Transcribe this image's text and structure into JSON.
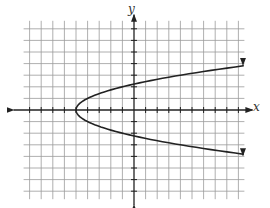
{
  "chart_data": {
    "type": "line",
    "title": "",
    "xlabel": "x",
    "ylabel": "y",
    "xlim": [
      -9,
      9
    ],
    "ylim": [
      -7,
      7
    ],
    "grid": true,
    "grid_step": 1,
    "axis_ticks": true,
    "series": [
      {
        "name": "parabola x = y^2 - 5",
        "orientation": "opens right",
        "vertex": [
          -5,
          0
        ],
        "y_intercepts": [
          2.24,
          -2.24
        ],
        "points": [
          [
            10.2,
            3.9
          ],
          [
            7.25,
            3.5
          ],
          [
            4.0,
            3.0
          ],
          [
            1.25,
            2.5
          ],
          [
            -1.0,
            2.0
          ],
          [
            -2.75,
            1.5
          ],
          [
            -4.0,
            1.0
          ],
          [
            -4.75,
            0.5
          ],
          [
            -5.0,
            0.0
          ],
          [
            -4.75,
            -0.5
          ],
          [
            -4.0,
            -1.0
          ],
          [
            -2.75,
            -1.5
          ],
          [
            -1.0,
            -2.0
          ],
          [
            1.25,
            -2.5
          ],
          [
            4.0,
            -3.0
          ],
          [
            7.25,
            -3.5
          ],
          [
            10.2,
            -3.9
          ]
        ],
        "arrows_at_ends": true
      }
    ]
  },
  "labels": {
    "x": "x",
    "y": "y"
  },
  "style": {
    "grid_color": "#9a9a9a",
    "axis_color": "#222222",
    "curve_color": "#222222"
  }
}
